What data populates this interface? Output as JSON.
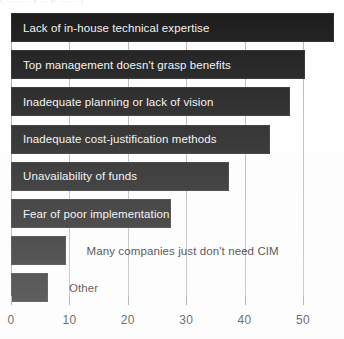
{
  "chart_data": {
    "type": "bar",
    "orientation": "horizontal",
    "title": "",
    "xlabel": "",
    "ylabel": "",
    "xlim": [
      0,
      50
    ],
    "xticks": [
      0,
      10,
      20,
      30,
      40,
      50
    ],
    "xtick_labels": [
      "0",
      "10",
      "20",
      "30",
      "40",
      "50"
    ],
    "grid": true,
    "legend": false,
    "bar_color": "#1a1a1a",
    "categories": [
      "Lack of in-house technical expertise",
      "Top management doesn't grasp benefits",
      "Inadequate planning or lack of vision",
      "Inadequate cost-justification methods",
      "Unavailability of funds",
      "Fear of poor implementation",
      "Many companies just don't need CIM",
      "Other"
    ],
    "values": [
      55,
      50,
      47.5,
      44,
      37,
      27,
      9,
      6
    ],
    "label_placement": [
      "inside",
      "inside",
      "inside",
      "inside",
      "inside",
      "inside",
      "outside",
      "outside"
    ]
  },
  "clipped_caption": "(  ......... y ... p ....... )"
}
